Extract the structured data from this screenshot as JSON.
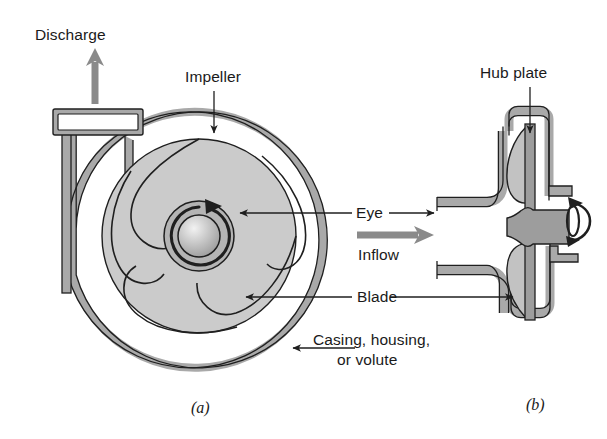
{
  "figure": {
    "panels": [
      {
        "id": "a",
        "caption": "(a)",
        "view": "front-view-cutaway"
      },
      {
        "id": "b",
        "caption": "(b)",
        "view": "side-section-view"
      }
    ],
    "labels": {
      "discharge": "Discharge",
      "impeller": "Impeller",
      "eye": "Eye",
      "inflow": "Inflow",
      "blade": "Blade",
      "casing_line1": "Casing, housing,",
      "casing_line2": "or volute",
      "casing_full": "Casing, housing, or volute",
      "hub_plate": "Hub plate"
    },
    "colors": {
      "ink": "#1a1a1a",
      "outline": "#1f1f1f",
      "casing_wall": "#a9a9a9",
      "impeller_fill": "#cbcbcb",
      "blade_fill": "#c2c2c2",
      "hub_fill": "#b4b4b4",
      "shaft_fill": "#9d9d9d",
      "arrow_gray": "#8a8a8a",
      "background": "#ffffff"
    },
    "geometry": {
      "impeller_blade_count": 5,
      "rotation_direction": "clockwise"
    }
  }
}
